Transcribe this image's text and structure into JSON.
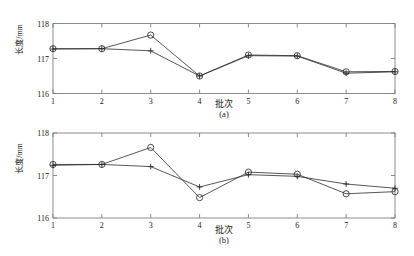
{
  "figure": {
    "background_color": "#ffffff",
    "line_color": "#2b2b2b",
    "marker_color": "#2b2b2b",
    "axis_color": "#808080"
  },
  "chart_data": [
    {
      "type": "line",
      "panel_label": "(a)",
      "title": "",
      "xlabel": "批次",
      "ylabel": "长度/mm",
      "x": [
        1,
        2,
        3,
        4,
        5,
        6,
        7,
        8
      ],
      "xticklabels": [
        "1",
        "2",
        "3",
        "4",
        "5",
        "6",
        "7",
        "8"
      ],
      "yticklabels": [
        "116",
        "117",
        "118"
      ],
      "yticks": [
        116,
        117,
        118
      ],
      "xlim": [
        1,
        8
      ],
      "ylim": [
        116,
        118
      ],
      "grid": false,
      "legend": "none",
      "series": [
        {
          "name": "circle-series",
          "marker": "circle",
          "values": [
            117.28,
            117.28,
            117.67,
            116.5,
            117.1,
            117.08,
            116.62,
            116.63
          ]
        },
        {
          "name": "plus-series",
          "marker": "plus",
          "values": [
            117.27,
            117.28,
            117.22,
            116.5,
            117.08,
            117.07,
            116.58,
            116.62
          ]
        }
      ]
    },
    {
      "type": "line",
      "panel_label": "(b)",
      "title": "",
      "xlabel": "批次",
      "ylabel": "长度/mm",
      "x": [
        1,
        2,
        3,
        4,
        5,
        6,
        7,
        8
      ],
      "xticklabels": [
        "1",
        "2",
        "3",
        "4",
        "5",
        "6",
        "7",
        "8"
      ],
      "yticklabels": [
        "116",
        "117",
        "118"
      ],
      "yticks": [
        116,
        117,
        118
      ],
      "xlim": [
        1,
        8
      ],
      "ylim": [
        116,
        118
      ],
      "grid": false,
      "legend": "none",
      "series": [
        {
          "name": "circle-series",
          "marker": "circle",
          "values": [
            117.26,
            117.26,
            117.66,
            116.48,
            117.08,
            117.03,
            116.57,
            116.62
          ]
        },
        {
          "name": "plus-series",
          "marker": "plus",
          "values": [
            117.24,
            117.26,
            117.21,
            116.73,
            117.02,
            116.98,
            116.8,
            116.7
          ]
        }
      ]
    }
  ]
}
